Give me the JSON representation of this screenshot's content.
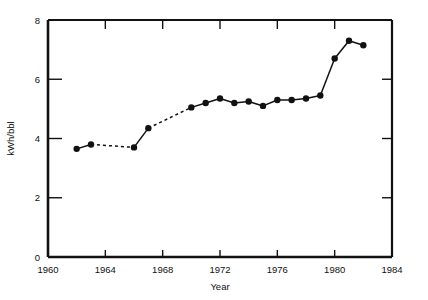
{
  "chart_data": {
    "type": "line",
    "title": "",
    "subtitle": "",
    "xlabel": "Year",
    "ylabel": "kWh/bbl",
    "xlim": [
      1960,
      1984
    ],
    "ylim": [
      0,
      8
    ],
    "xticks": [
      1960,
      1964,
      1968,
      1972,
      1976,
      1980,
      1984
    ],
    "yticks": [
      0,
      2,
      4,
      6,
      8
    ],
    "xtick_labels": [
      "1960",
      "1964",
      "1968",
      "1972",
      "1976",
      "1980",
      "1984"
    ],
    "ytick_labels": [
      "0",
      "2",
      "4",
      "6",
      "8"
    ],
    "grid": false,
    "legend": null,
    "legend_position": "none",
    "marker": "filled-circle",
    "line_color": "#111111",
    "marker_color": "#111111",
    "axis_color": "#111111",
    "background_color": "#ffffff",
    "x": [
      1962,
      1963,
      1966,
      1967,
      1970,
      1971,
      1972,
      1973,
      1974,
      1975,
      1976,
      1977,
      1978,
      1979,
      1980,
      1981,
      1982
    ],
    "values": [
      3.65,
      3.8,
      3.7,
      4.35,
      5.05,
      5.2,
      5.35,
      5.2,
      5.25,
      5.1,
      5.3,
      5.3,
      5.35,
      5.45,
      6.7,
      7.3,
      7.15
    ],
    "series": [
      {
        "name": "kWh/bbl",
        "points": [
          {
            "x": 1962,
            "y": 3.65,
            "segment_style": "solid"
          },
          {
            "x": 1963,
            "y": 3.8,
            "segment_style": "dashed"
          },
          {
            "x": 1966,
            "y": 3.7,
            "segment_style": "solid"
          },
          {
            "x": 1967,
            "y": 4.35,
            "segment_style": "dashed"
          },
          {
            "x": 1970,
            "y": 5.05,
            "segment_style": "solid"
          },
          {
            "x": 1971,
            "y": 5.2,
            "segment_style": "solid"
          },
          {
            "x": 1972,
            "y": 5.35,
            "segment_style": "solid"
          },
          {
            "x": 1973,
            "y": 5.2,
            "segment_style": "solid"
          },
          {
            "x": 1974,
            "y": 5.25,
            "segment_style": "solid"
          },
          {
            "x": 1975,
            "y": 5.1,
            "segment_style": "solid"
          },
          {
            "x": 1976,
            "y": 5.3,
            "segment_style": "solid"
          },
          {
            "x": 1977,
            "y": 5.3,
            "segment_style": "solid"
          },
          {
            "x": 1978,
            "y": 5.35,
            "segment_style": "solid"
          },
          {
            "x": 1979,
            "y": 5.45,
            "segment_style": "solid"
          },
          {
            "x": 1980,
            "y": 6.7,
            "segment_style": "solid"
          },
          {
            "x": 1981,
            "y": 7.3,
            "segment_style": "solid"
          },
          {
            "x": 1982,
            "y": 7.15,
            "segment_style": "none"
          }
        ]
      }
    ],
    "annotations": []
  },
  "axes": {
    "x_title": "Year",
    "y_title": "kWh/bbl"
  }
}
